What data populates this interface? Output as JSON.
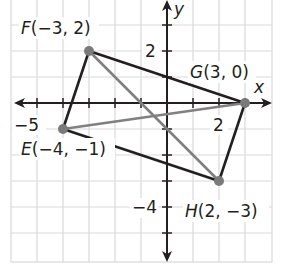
{
  "figure": {
    "type": "coordinate-plane",
    "axes": {
      "x_label": "x",
      "y_label": "y",
      "x_tick_labels": [
        {
          "value": -5,
          "text": "−5"
        },
        {
          "value": 2,
          "text": "2"
        }
      ],
      "y_tick_labels": [
        {
          "value": 2,
          "text": "2"
        },
        {
          "value": -4,
          "text": "−4"
        }
      ],
      "x_range": [
        -6,
        4
      ],
      "y_range": [
        -6,
        4
      ],
      "grid": true
    },
    "points": [
      {
        "name": "E",
        "x": -4,
        "y": -1,
        "label": "E(−4, −1)"
      },
      {
        "name": "F",
        "x": -3,
        "y": 2,
        "label": "F(−3, 2)"
      },
      {
        "name": "G",
        "x": 3,
        "y": 0,
        "label": "G(3, 0)"
      },
      {
        "name": "H",
        "x": 2,
        "y": -3,
        "label": "H(2, −3)"
      }
    ],
    "sides": [
      [
        "E",
        "F"
      ],
      [
        "F",
        "G"
      ],
      [
        "G",
        "H"
      ],
      [
        "H",
        "E"
      ]
    ],
    "diagonals": [
      [
        "F",
        "H"
      ],
      [
        "E",
        "G"
      ]
    ],
    "colors": {
      "grid": "#d9d9d9",
      "axis": "#231f20",
      "side": "#231f20",
      "diagonal": "#808080",
      "point": "#7a7a7a",
      "background": "#ffffff"
    }
  }
}
